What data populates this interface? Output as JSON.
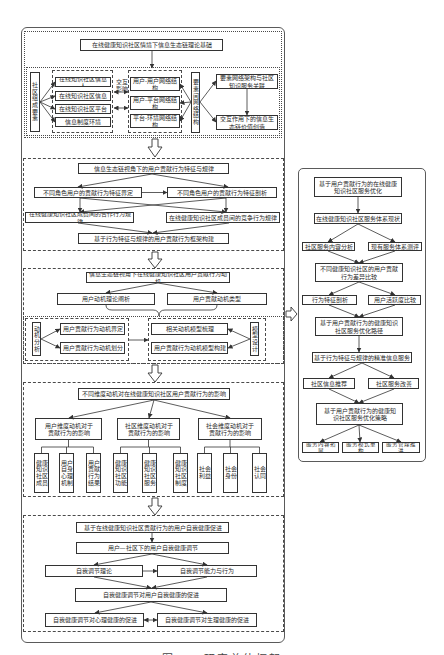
{
  "figure": {
    "caption": "图1-1 研究总体框架"
  },
  "main_framework": {
    "section1": {
      "title": "在线健康知识社区情境下信息生态链理论基础",
      "elements_label": "社区组成要素",
      "elements": [
        "在线知识社区信息人",
        "在线知识社区信息",
        "在线知识社区平台",
        "信息制度环境"
      ],
      "interaction_label": "交互影响",
      "networks": [
        "用户-用户网络结构",
        "用户-平台网络结构",
        "平台-环境网络结构"
      ],
      "network_label": "要素间网络结构",
      "outcomes": [
        "要素网络架构与社区知识服务关联",
        "交互作用下的信息生态链价值创造"
      ]
    },
    "section2": {
      "title": "信息生态链视角下的用户贡献行为特征与规律",
      "row1": [
        "不同角色用户的贡献行为特征界定",
        "不同角色用户的贡献行为特征剖析"
      ],
      "row2": [
        "在线健康知识社区成员间的合作行为规律",
        "在线健康知识社区成员间的竞争行为规律"
      ],
      "result": "基于行为特征与规律的用户贡献行为框架构建"
    },
    "section3": {
      "title": "信息生态链视角下在线健康知识社区用户贡献行为动机",
      "row1": [
        "用户动机理论阐析",
        "用户贡献动机类型"
      ],
      "analysis_label": "动机分析",
      "analysis_items": [
        "用户贡献行为动机界定",
        "用户贡献行为动机划分"
      ],
      "model_items": [
        "相关动机模型梳理",
        "用户贡献行为动机模型构建"
      ],
      "model_label": "模型设计"
    },
    "section4": {
      "title": "不同维度动机对在线健康知识社区用户贡献行为的影响",
      "dimensions": [
        {
          "label": "用户维度动机对于贡献行为的影响",
          "factors": [
            "健康知识社区成员",
            "用户自身心理机制",
            "用户贡献行为结果"
          ]
        },
        {
          "label": "社区维度动机对于贡献行为的影响",
          "factors": [
            "健康知识社区功能",
            "健康知识社区服务",
            "健康知识社区制度"
          ]
        },
        {
          "label": "社会维度动机对于贡献行为的影响",
          "factors": [
            "社会利益",
            "社会身份",
            "社会认同"
          ]
        }
      ]
    },
    "section5": {
      "title": "基于在线健康知识社区贡献行为的用户自我健康促进",
      "regulation": "用户—社区下的用户自我健康调节",
      "row1": [
        "自我调节理论",
        "自我调节能力与行为"
      ],
      "promotion": "自我健康调节对用户自我健康的促进",
      "row2": [
        "自我健康调节对心理健康的促进",
        "自我健康调节对生理健康的促进"
      ]
    }
  },
  "side_panel": {
    "title": "基于用户贡献行为的在线健康知识社区服务优化",
    "status": "在线健康知识社区服务体系现状",
    "row1": [
      "社区服务内容分析",
      "现有服务体系测评"
    ],
    "comparison": "不同健康知识社区的用户贡献行为差异比较",
    "row2": [
      "行为特征剖析",
      "用户活跃度比较"
    ],
    "path": "基于用户贡献行为的健康知识社区服务优化路径",
    "precise_service": "基于行为特征与规律的精准信息服务",
    "row3": [
      "社区信息推荐",
      "社区服务改善"
    ],
    "strategy": "基于用户贡献行为的健康知识社区服务优化策略",
    "row4": [
      "服务内容拓展",
      "服务模式重构",
      "服务管理推进"
    ]
  },
  "colors": {
    "line": "#333333",
    "frame": "#5a5a5a",
    "background": "#ffffff"
  }
}
